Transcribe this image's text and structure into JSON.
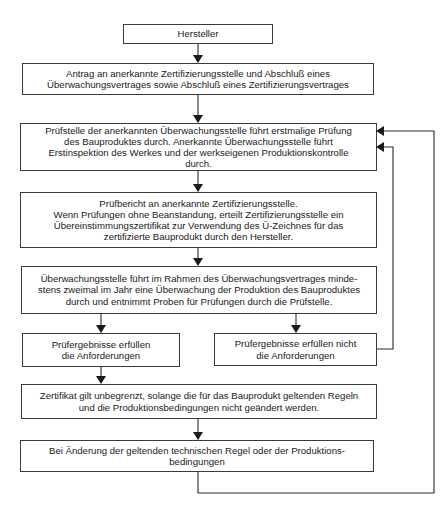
{
  "diagram": {
    "type": "flowchart",
    "language": "de",
    "nodes": [
      {
        "id": "hersteller",
        "text": "Hersteller"
      },
      {
        "id": "antrag",
        "text": "Antrag an anerkannte Zertifizierungsstelle und Abschluß eines\nÜberwachungsvertrages sowie Abschluß eines Zertifizierungsvertrages"
      },
      {
        "id": "erstpruefung",
        "text": "Prüfstelle der anerkannten Überwachungsstelle führt erstmalige Prüfung\ndes Bauproduktes durch. Anerkannte Überwachungsstelle führt\nErstinspektion des Werkes und der werkseigenen Produktionskontrolle\ndurch."
      },
      {
        "id": "pruefbericht",
        "text": "Prüfbericht an anerkannte Zertifizierungsstelle.\nWenn Prüfungen ohne Beanstandung, erteilt Zertifizierungsstelle ein\nÜbereinstimmungszertifikat zur Verwendung des Ü-Zeichnes für das\nzertifizierte Bauprodukt durch den Hersteller."
      },
      {
        "id": "ueberwachung",
        "text": "Überwachungsstelle führt im Rahmen des Überwachungsvertrages minde-\nstens zweimal im Jahr eine Überwachung der Produktion des Bauproduktes\ndurch und entnimmt Proben für Prüfungen durch die Prüfstelle."
      },
      {
        "id": "erfuellt",
        "text": "Prüfergebnisse erfüllen\ndie Anforderungen"
      },
      {
        "id": "nicht_erfuellt",
        "text": "Prüfergebnisse erfüllen nicht\ndie Anforderungen"
      },
      {
        "id": "zertifikat",
        "text": "Zertifikat gilt unbegrenzt, solange die für das Bauprodukt geltenden Regeln\nund die Produktionsbedingungen nicht geändert werden."
      },
      {
        "id": "aenderung",
        "text": "Bei Änderung der geltenden technischen Regel oder der Produktions-\nbedingungen"
      }
    ],
    "edges": [
      {
        "from": "hersteller",
        "to": "antrag"
      },
      {
        "from": "antrag",
        "to": "erstpruefung"
      },
      {
        "from": "erstpruefung",
        "to": "pruefbericht"
      },
      {
        "from": "pruefbericht",
        "to": "ueberwachung"
      },
      {
        "from": "ueberwachung",
        "to": "erfuellt"
      },
      {
        "from": "ueberwachung",
        "to": "nicht_erfuellt"
      },
      {
        "from": "erfuellt",
        "to": "zertifikat"
      },
      {
        "from": "zertifikat",
        "to": "aenderung"
      },
      {
        "from": "nicht_erfuellt",
        "to": "erstpruefung",
        "route": "loop-right-inner"
      },
      {
        "from": "aenderung",
        "to": "erstpruefung",
        "route": "loop-right-outer"
      }
    ]
  },
  "colors": {
    "line": "#2a2a2a",
    "box_border": "#3a3a3a",
    "background": "#ffffff"
  }
}
